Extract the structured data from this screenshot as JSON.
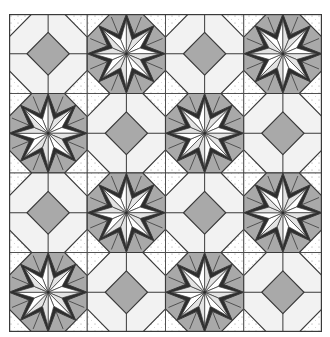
{
  "figure": {
    "rows": 4,
    "cols": 4,
    "layout": [
      [
        "diamond",
        "star",
        "diamond",
        "star"
      ],
      [
        "star",
        "diamond",
        "star",
        "diamond"
      ],
      [
        "diamond",
        "star",
        "diamond",
        "star"
      ],
      [
        "star",
        "diamond",
        "star",
        "diamond"
      ]
    ]
  },
  "colors": {
    "background": "#ffffff",
    "outline": "#3a3a3a",
    "dark_band": "#2e2e2e",
    "medium_gray": "#a9a9a9",
    "light_fill": "#f2f2f2",
    "star_white": "#ffffff",
    "star_light": "#e4e4e4",
    "dot": "#9a9a9a",
    "dotted_bg": "#ffffff"
  }
}
